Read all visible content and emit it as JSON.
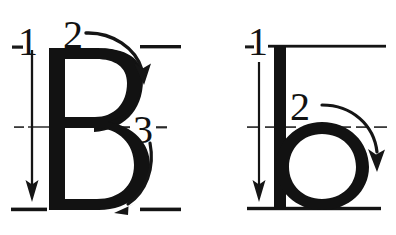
{
  "figure": {
    "type": "handwriting-stroke-order-diagram",
    "background_color": "#ffffff",
    "ink_color": "#121212",
    "guideline_color": "#333333",
    "panel_count": 2
  },
  "panels": [
    {
      "id": "uppercase-b",
      "letter": "B",
      "letter_case": "uppercase",
      "stroke_count": 3,
      "strokes": [
        {
          "number": "1",
          "label_x": 40,
          "label_y": 52,
          "direction": "downward",
          "description": "vertical stem drawn top to bottom"
        },
        {
          "number": "2",
          "label_x": 62,
          "label_y": 48,
          "direction": "clockwise-arc",
          "description": "upper bowl drawn left to right curving down"
        },
        {
          "number": "3",
          "label_x": 133,
          "label_y": 143,
          "direction": "clockwise-arc",
          "description": "lower bowl drawn right curving down to the left"
        }
      ],
      "guidelines": [
        {
          "name": "ascender-line",
          "y": 47,
          "style": "dashed"
        },
        {
          "name": "midline",
          "y": 127,
          "style": "dashed"
        },
        {
          "name": "baseline",
          "y": 209,
          "style": "dashed"
        }
      ]
    },
    {
      "id": "lowercase-b",
      "letter": "b",
      "letter_case": "lowercase",
      "stroke_count": 2,
      "strokes": [
        {
          "number": "1",
          "label_x": 251,
          "label_y": 53,
          "direction": "downward",
          "description": "tall ascender stem drawn top to bottom"
        },
        {
          "number": "2",
          "label_x": 289,
          "label_y": 118,
          "direction": "clockwise-arc",
          "description": "round bowl drawn clockwise from the midline"
        }
      ],
      "guidelines": [
        {
          "name": "ascender-line",
          "y": 46,
          "style": "solid"
        },
        {
          "name": "midline",
          "y": 127,
          "style": "dashed"
        },
        {
          "name": "baseline",
          "y": 208,
          "style": "solid"
        }
      ]
    }
  ],
  "labels": {
    "uppercase_stroke_1": "1",
    "uppercase_stroke_2": "2",
    "uppercase_stroke_3": "3",
    "lowercase_stroke_1": "1",
    "lowercase_stroke_2": "2"
  }
}
